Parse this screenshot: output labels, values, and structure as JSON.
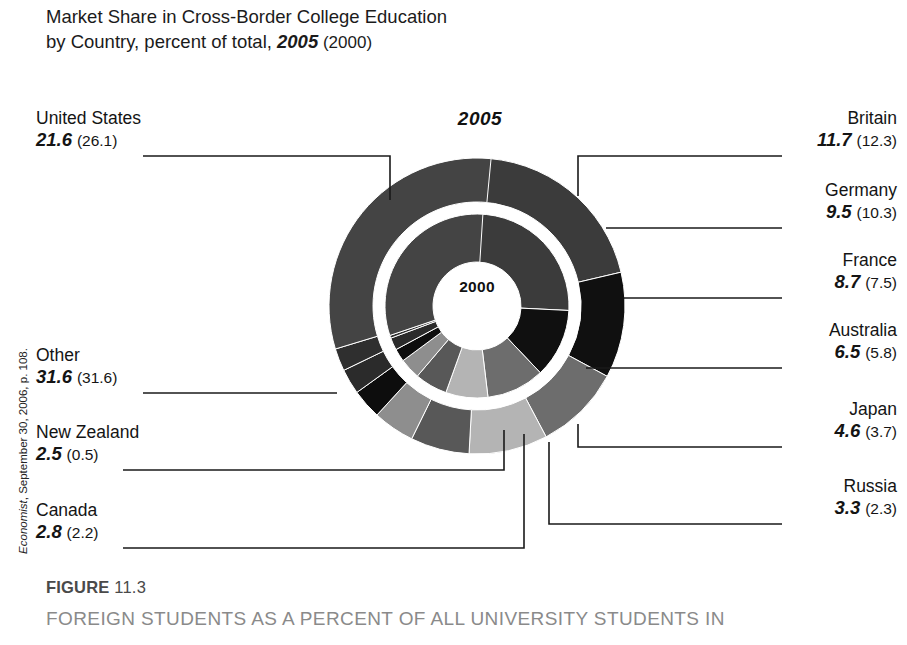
{
  "title": {
    "line1": "Market Share in Cross-Border College Education",
    "line2_prefix": "by Country, percent of total, ",
    "line2_year_emph": "2005",
    "line2_year_paren": " (2000)"
  },
  "source_note": {
    "publication": "Economist",
    "rest": ", September 30, 2006, p. 108."
  },
  "ring_labels": {
    "outer": "2005",
    "inner": "2000"
  },
  "figure": {
    "label": "FIGURE",
    "number": "11.3",
    "caption": "FOREIGN STUDENTS AS A PERCENT OF ALL UNIVERSITY STUDENTS IN"
  },
  "colors": {
    "united_states": "#3b3b3b",
    "britain": "#101010",
    "germany": "#6d6d6d",
    "france": "#b4b4b4",
    "australia": "#585858",
    "japan": "#8e8e8e",
    "russia": "#0d0d0d",
    "canada": "#2b2b2b",
    "new_zealand": "#2f2f2f",
    "other": "#444444",
    "leader_line": "#1a1a1a",
    "background": "#ffffff"
  },
  "chart_data": {
    "type": "pie",
    "title": "Market Share in Cross-Border College Education by Country, percent of total, 2005 (2000)",
    "subtitle": "",
    "xlabel": "",
    "ylabel": "",
    "units": "percent of total",
    "legend_position": "callout-labels",
    "grid": false,
    "rings": [
      {
        "name": "2005",
        "label": "2005",
        "position": "outer"
      },
      {
        "name": "2000",
        "label": "2000",
        "position": "inner"
      }
    ],
    "categories": [
      "United States",
      "Britain",
      "Germany",
      "France",
      "Australia",
      "Japan",
      "Russia",
      "Canada",
      "New Zealand",
      "Other"
    ],
    "series": [
      {
        "name": "2005",
        "values": [
          21.6,
          11.7,
          9.5,
          8.7,
          6.5,
          4.6,
          3.3,
          2.8,
          2.5,
          31.6
        ]
      },
      {
        "name": "2000",
        "values": [
          26.1,
          12.3,
          10.3,
          7.5,
          5.8,
          3.7,
          2.3,
          2.2,
          0.5,
          31.6
        ]
      }
    ],
    "slices": [
      {
        "label": "United States",
        "v2005": 21.6,
        "v2000": 26.1,
        "color": "#3b3b3b",
        "side": "left"
      },
      {
        "label": "Britain",
        "v2005": 11.7,
        "v2000": 12.3,
        "color": "#101010",
        "side": "right"
      },
      {
        "label": "Germany",
        "v2005": 9.5,
        "v2000": 10.3,
        "color": "#6d6d6d",
        "side": "right"
      },
      {
        "label": "France",
        "v2005": 8.7,
        "v2000": 7.5,
        "color": "#b4b4b4",
        "side": "right"
      },
      {
        "label": "Australia",
        "v2005": 6.5,
        "v2000": 5.8,
        "color": "#585858",
        "side": "right"
      },
      {
        "label": "Japan",
        "v2005": 4.6,
        "v2000": 3.7,
        "color": "#8e8e8e",
        "side": "right"
      },
      {
        "label": "Russia",
        "v2005": 3.3,
        "v2000": 2.3,
        "color": "#0d0d0d",
        "side": "right"
      },
      {
        "label": "Canada",
        "v2005": 2.8,
        "v2000": 2.2,
        "color": "#2b2b2b",
        "side": "left"
      },
      {
        "label": "New Zealand",
        "v2005": 2.5,
        "v2000": 0.5,
        "color": "#2f2f2f",
        "side": "left"
      },
      {
        "label": "Other",
        "v2005": 31.6,
        "v2000": 31.6,
        "color": "#444444",
        "side": "left"
      }
    ]
  },
  "callouts": {
    "united_states": {
      "name": "United States",
      "v2005": "21.6",
      "v2000": "(26.1)"
    },
    "other": {
      "name": "Other",
      "v2005": "31.6",
      "v2000": "(31.6)"
    },
    "new_zealand": {
      "name": "New Zealand",
      "v2005": "2.5",
      "v2000": "(0.5)"
    },
    "canada": {
      "name": "Canada",
      "v2005": "2.8",
      "v2000": "(2.2)"
    },
    "britain": {
      "name": "Britain",
      "v2005": "11.7",
      "v2000": "(12.3)"
    },
    "germany": {
      "name": "Germany",
      "v2005": "9.5",
      "v2000": "(10.3)"
    },
    "france": {
      "name": "France",
      "v2005": "8.7",
      "v2000": "(7.5)"
    },
    "australia": {
      "name": "Australia",
      "v2005": "6.5",
      "v2000": "(5.8)"
    },
    "japan": {
      "name": "Japan",
      "v2005": "4.6",
      "v2000": "(3.7)"
    },
    "russia": {
      "name": "Russia",
      "v2005": "3.3",
      "v2000": "(2.3)"
    }
  }
}
